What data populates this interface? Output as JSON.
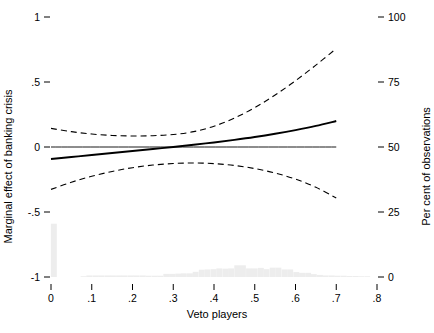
{
  "chart_data": {
    "type": "line",
    "title": "",
    "xlabel": "Veto players",
    "ylabel": "Marginal effect of banking crisis",
    "ylabel_right": "Per cent of observations",
    "xlim": [
      0,
      0.8
    ],
    "ylim": [
      -1,
      1
    ],
    "ylim_right": [
      0,
      100
    ],
    "grid": false,
    "legend": "none",
    "xticks": [
      0,
      0.1,
      0.2,
      0.3,
      0.4,
      0.5,
      0.6,
      0.7,
      0.8
    ],
    "xticklabels": [
      "0",
      ".1",
      ".2",
      ".3",
      ".4",
      ".5",
      ".6",
      ".7",
      ".8"
    ],
    "yticks_left": [
      -1,
      -0.5,
      0,
      0.5,
      1
    ],
    "yticklabels_left": [
      "-1",
      "-.5",
      "0",
      ".5",
      "1"
    ],
    "yticks_right": [
      0,
      25,
      50,
      75,
      100
    ],
    "yticklabels_right": [
      "0",
      "25",
      "50",
      "75",
      "100"
    ],
    "series": [
      {
        "name": "Marginal effect",
        "style": "solid",
        "color": "#000000",
        "x": [
          0.0,
          0.05,
          0.1,
          0.15,
          0.2,
          0.25,
          0.3,
          0.35,
          0.4,
          0.45,
          0.5,
          0.55,
          0.6,
          0.65,
          0.7
        ],
        "values": [
          -0.092,
          -0.077,
          -0.062,
          -0.046,
          -0.031,
          -0.015,
          0.0,
          0.017,
          0.035,
          0.055,
          0.077,
          0.102,
          0.13,
          0.162,
          0.2
        ]
      },
      {
        "name": "Upper 95% confidence bound",
        "style": "dashed",
        "color": "#000000",
        "x": [
          0.0,
          0.05,
          0.1,
          0.15,
          0.2,
          0.25,
          0.3,
          0.35,
          0.4,
          0.45,
          0.5,
          0.55,
          0.6,
          0.65,
          0.7
        ],
        "values": [
          0.143,
          0.118,
          0.1,
          0.089,
          0.085,
          0.087,
          0.096,
          0.118,
          0.16,
          0.222,
          0.303,
          0.4,
          0.51,
          0.63,
          0.757
        ]
      },
      {
        "name": "Lower 95% confidence bound",
        "style": "dashed",
        "color": "#000000",
        "x": [
          0.0,
          0.05,
          0.1,
          0.15,
          0.2,
          0.25,
          0.3,
          0.35,
          0.4,
          0.45,
          0.5,
          0.55,
          0.6,
          0.65,
          0.7
        ],
        "values": [
          -0.326,
          -0.271,
          -0.225,
          -0.188,
          -0.159,
          -0.139,
          -0.127,
          -0.123,
          -0.128,
          -0.142,
          -0.166,
          -0.2,
          -0.247,
          -0.31,
          -0.392
        ]
      },
      {
        "name": "Zero reference line",
        "style": "solid-thin",
        "color": "#000000",
        "x": [
          0.0,
          0.7
        ],
        "values": [
          0.0,
          0.0
        ]
      }
    ],
    "histogram": {
      "name": "Distribution of observations",
      "color": "#ededed",
      "axis": "right",
      "bin_width": 0.0145,
      "bin_centers": [
        0.007,
        0.022,
        0.036,
        0.051,
        0.065,
        0.08,
        0.094,
        0.109,
        0.123,
        0.138,
        0.152,
        0.167,
        0.181,
        0.196,
        0.21,
        0.225,
        0.239,
        0.254,
        0.268,
        0.283,
        0.297,
        0.312,
        0.326,
        0.341,
        0.355,
        0.37,
        0.384,
        0.399,
        0.413,
        0.428,
        0.442,
        0.457,
        0.471,
        0.486,
        0.5,
        0.515,
        0.529,
        0.544,
        0.558,
        0.573,
        0.587,
        0.602,
        0.616,
        0.631,
        0.645,
        0.66,
        0.674,
        0.689,
        0.703,
        0.718,
        0.732,
        0.747,
        0.761,
        0.776
      ],
      "values": [
        20.5,
        0.0,
        0.0,
        0.0,
        0.0,
        0.3,
        0.6,
        0.6,
        0.6,
        0.6,
        0.6,
        0.6,
        0.6,
        0.6,
        0.6,
        0.6,
        0.5,
        0.5,
        0.5,
        1.2,
        1.2,
        1.3,
        1.4,
        1.4,
        2.0,
        2.8,
        2.9,
        3.0,
        3.3,
        3.2,
        3.3,
        4.5,
        4.5,
        3.3,
        3.3,
        3.5,
        3.0,
        3.6,
        3.6,
        2.9,
        2.9,
        1.9,
        1.6,
        1.6,
        1.1,
        0.8,
        0.6,
        0.6,
        0.5,
        0.5,
        0.4,
        0.4,
        0.3,
        0.3
      ]
    }
  }
}
